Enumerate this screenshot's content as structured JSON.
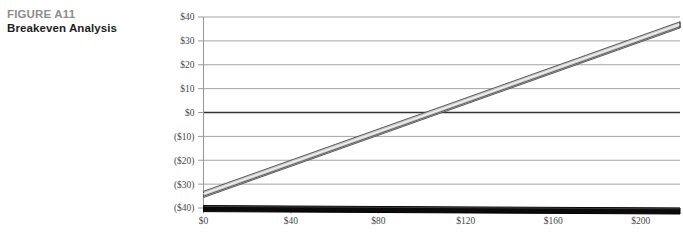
{
  "caption": {
    "label": "FIGURE A11",
    "title": "Breakeven Analysis",
    "label_color": "#8e8e8e",
    "title_color": "#1d1d1d"
  },
  "chart_data": {
    "type": "line",
    "title": "Breakeven Analysis",
    "xlabel": "",
    "ylabel": "",
    "xlim": [
      0,
      218
    ],
    "ylim": [
      -40,
      40
    ],
    "grid": true,
    "legend": "none",
    "x_ticks": [
      0,
      40,
      80,
      120,
      160,
      200
    ],
    "x_tick_labels": [
      "$0",
      "$40",
      "$80",
      "$120",
      "$160",
      "$200"
    ],
    "y_ticks": [
      40,
      30,
      20,
      10,
      0,
      -10,
      -20,
      -30,
      -40
    ],
    "y_tick_labels": [
      "$40",
      "$30",
      "$20",
      "$10",
      "$0",
      "($10)",
      "($20)",
      "($30)",
      "($40)"
    ],
    "zero_line_emphasized": true,
    "series": [
      {
        "name": "profit-line",
        "style": "3d-band-gray",
        "x": [
          0,
          218
        ],
        "values": [
          -33,
          38
        ]
      },
      {
        "name": "baseline-line",
        "style": "3d-band-black",
        "x": [
          0,
          218
        ],
        "values": [
          -39,
          -40
        ]
      }
    ],
    "colors": {
      "gridline": "#9a9a9a",
      "zero_gridline": "#333333",
      "axis": "#9a9a9a",
      "profit_band_fill": "#c9c9c9",
      "profit_band_edge": "#4d4d4d",
      "baseline_fill": "#0a0a0a",
      "baseline_edge": "#000000",
      "tick_text": "#4a4a4a"
    }
  }
}
